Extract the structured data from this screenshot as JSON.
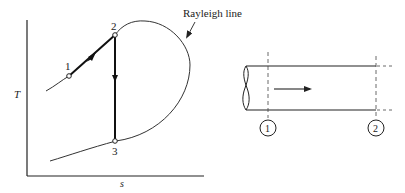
{
  "ts_diagram": {
    "y_axis_label": "T",
    "x_axis_label": "s",
    "curve_label": "Rayleigh line",
    "points": [
      {
        "id": "1",
        "label": "1"
      },
      {
        "id": "2",
        "label": "2"
      },
      {
        "id": "3",
        "label": "3"
      }
    ],
    "process_paths": [
      "1 to 2 (heating along Rayleigh line)",
      "2 to 3 (normal shock, vertical drop)"
    ]
  },
  "duct_diagram": {
    "stations": [
      {
        "id": "1",
        "label": "1"
      },
      {
        "id": "2",
        "label": "2"
      }
    ],
    "flow_direction": "left-to-right"
  },
  "colors": {
    "line": "#222222",
    "background": "#ffffff"
  }
}
